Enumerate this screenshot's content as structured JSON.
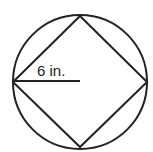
{
  "diagram": {
    "radius_label": "6 in.",
    "shapes": [
      "circle",
      "inscribed-square",
      "radius-segment"
    ],
    "stroke_color": "#222222"
  }
}
